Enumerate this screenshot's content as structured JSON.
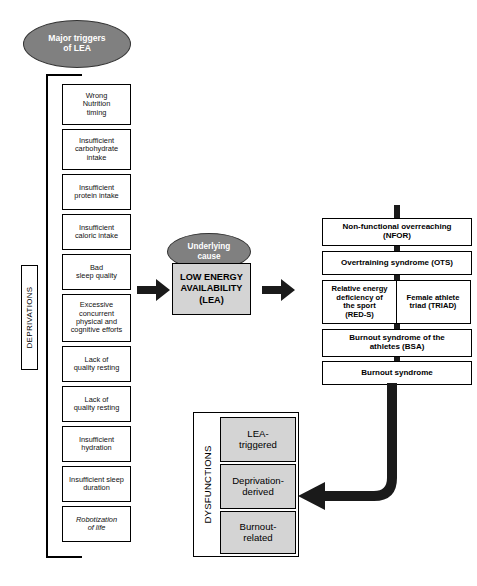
{
  "diagram": {
    "colors": {
      "ellipse_fill": "#808080",
      "ellipse_text": "#ffffff",
      "highlight_box_fill": "#d4d4d4",
      "box_fill": "#ffffff",
      "stroke": "#000000",
      "arrow": "#1a1a1a"
    },
    "ellipses": {
      "major_triggers": "Major triggers\nof LEA",
      "underlying_cause": "Underlying\ncause"
    },
    "center": {
      "lea_box": "LOW ENERGY\nAVAILABILITY\n(LEA)"
    },
    "left_group": {
      "label": "DEPRIVATIONS",
      "items": [
        {
          "text": "Wrong\nNutrition\ntiming",
          "italic": false
        },
        {
          "text": "Insufficient\ncarbohydrate\nintake",
          "italic": false
        },
        {
          "text": "Insufficient\nprotein intake",
          "italic": false
        },
        {
          "text": "Insufficient\ncaloric intake",
          "italic": false
        },
        {
          "text": "Bad\nsleep quality",
          "italic": false
        },
        {
          "text": "Excessive\nconcurrent\nphysical and\ncognitive efforts",
          "italic": false
        },
        {
          "text": "Lack of\nquality resting",
          "italic": false
        },
        {
          "text": "Lack of\nquality resting",
          "italic": false
        },
        {
          "text": "Insufficient\nhydration",
          "italic": false
        },
        {
          "text": "Insufficient sleep\nduration",
          "italic": false
        },
        {
          "text": "Robotization\nof life",
          "italic": true
        }
      ]
    },
    "right_group": {
      "items": [
        {
          "type": "single",
          "text": "Non-functional overreaching\n(NFOR)"
        },
        {
          "type": "single",
          "text": "Overtraining syndrome (OTS)"
        },
        {
          "type": "split",
          "left": "Relative energy\ndeficiency of\nthe sport\n(RED-S)",
          "right": "Female athlete\ntriad (TRIAD)"
        },
        {
          "type": "single",
          "text": "Burnout syndrome of the\nathletes (BSA)"
        },
        {
          "type": "single",
          "text": "Burnout syndrome"
        }
      ]
    },
    "bottom_group": {
      "label": "DYSFUNCTIONS",
      "items": [
        "LEA-\ntriggered",
        "Deprivation-\nderived",
        "Burnout-\nrelated"
      ]
    },
    "arrows": {
      "triggers_to_lea": "arrow-right",
      "lea_to_dysfunctions": "arrow-right",
      "burnout_to_dysfunctions": "curved-arrow-left"
    }
  }
}
